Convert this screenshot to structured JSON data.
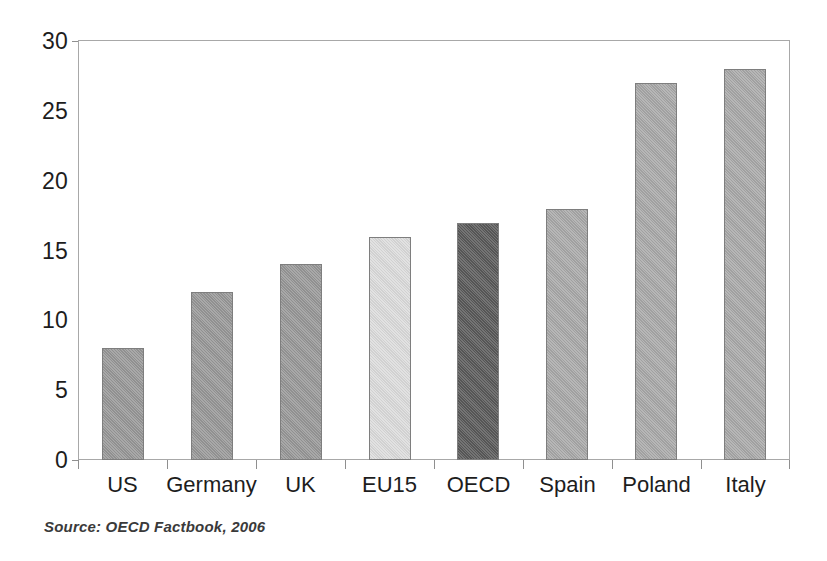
{
  "chart_data": {
    "type": "bar",
    "title": "",
    "subtitle": "",
    "xlabel": "",
    "ylabel": "",
    "categories": [
      "US",
      "Germany",
      "UK",
      "EU15",
      "OECD",
      "Spain",
      "Poland",
      "Italy"
    ],
    "values": [
      8,
      12,
      14,
      16,
      17,
      18,
      27,
      28
    ],
    "series": [
      {
        "name": "",
        "values": [
          8,
          12,
          14,
          16,
          17,
          18,
          27,
          28
        ]
      }
    ],
    "bar_colors": [
      "#989898",
      "#989898",
      "#989898",
      "#dcdcdc",
      "#5a5a5a",
      "#a9a9a9",
      "#a9a9a9",
      "#a9a9a9"
    ],
    "bar_border_color": "#7e7e7e",
    "ylim": [
      0,
      30
    ],
    "yticks": [
      0,
      5,
      10,
      15,
      20,
      25,
      30
    ],
    "ytick_labels": [
      "0",
      "5",
      "10",
      "15",
      "20",
      "25",
      "30"
    ],
    "grid": false,
    "legend": null,
    "legend_position": "none",
    "axis_color": "#a8a8a8",
    "background_color": "#ffffff",
    "data_labels": false
  },
  "source": {
    "text": "Source:  OECD Factbook, 2006"
  }
}
